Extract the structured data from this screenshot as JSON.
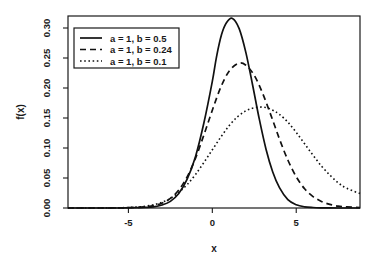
{
  "chart_data": {
    "type": "line",
    "title": "",
    "subtitle": "",
    "xlabel": "x",
    "ylabel": "f(x)",
    "xlim": [
      -8.6,
      8.8
    ],
    "ylim": [
      0.0,
      0.32
    ],
    "grid": false,
    "legend_position": "top-left",
    "x_ticks": [
      -5,
      0,
      5
    ],
    "x_tick_labels": [
      "-5",
      "0",
      "5"
    ],
    "y_ticks": [
      0.0,
      0.05,
      0.1,
      0.15,
      0.2,
      0.25,
      0.3
    ],
    "y_tick_labels": [
      "0.00",
      "0.05",
      "0.10",
      "0.15",
      "0.20",
      "0.25",
      "0.30"
    ],
    "series": [
      {
        "name": "a = 1, b = 0.5",
        "style": "solid",
        "color": "#111111",
        "peak_x": 0.55,
        "peak_y": 0.316,
        "params": {
          "a": 1,
          "b": 0.5
        },
        "x": [
          -8.6,
          -7.5,
          -6.5,
          -5.5,
          -4.5,
          -4.0,
          -3.5,
          -3.0,
          -2.5,
          -2.0,
          -1.5,
          -1.0,
          -0.5,
          0.0,
          0.25,
          0.55,
          0.85,
          1.2,
          1.6,
          2.0,
          2.4,
          2.8,
          3.2,
          3.6,
          4.0,
          4.5,
          5.0,
          5.5,
          6.0,
          6.5,
          7.0,
          7.5,
          8.0,
          8.8
        ],
        "y": [
          0.0,
          0.0,
          0.0,
          0.0,
          0.0005,
          0.001,
          0.002,
          0.005,
          0.011,
          0.024,
          0.048,
          0.086,
          0.142,
          0.211,
          0.252,
          0.289,
          0.309,
          0.316,
          0.299,
          0.259,
          0.205,
          0.148,
          0.098,
          0.06,
          0.034,
          0.014,
          0.0055,
          0.002,
          0.0008,
          0.0003,
          0.0001,
          0.0,
          0.0,
          0.0
        ]
      },
      {
        "name": "a = 1, b = 0.24",
        "style": "dashed",
        "color": "#111111",
        "peak_x": 1.55,
        "peak_y": 0.241,
        "params": {
          "a": 1,
          "b": 0.24
        },
        "x": [
          -8.6,
          -7.5,
          -6.5,
          -5.5,
          -4.5,
          -4.0,
          -3.5,
          -3.0,
          -2.5,
          -2.0,
          -1.5,
          -1.0,
          -0.5,
          0.0,
          0.5,
          1.0,
          1.55,
          2.0,
          2.5,
          3.0,
          3.5,
          4.0,
          4.5,
          5.0,
          5.5,
          6.0,
          6.5,
          7.0,
          7.5,
          8.0,
          8.8
        ],
        "y": [
          0.0,
          0.0,
          0.0,
          0.0002,
          0.001,
          0.002,
          0.004,
          0.008,
          0.016,
          0.03,
          0.052,
          0.083,
          0.122,
          0.163,
          0.201,
          0.228,
          0.241,
          0.238,
          0.221,
          0.191,
          0.154,
          0.115,
          0.08,
          0.052,
          0.032,
          0.019,
          0.011,
          0.006,
          0.003,
          0.0018,
          0.0008
        ]
      },
      {
        "name": "a = 1, b = 0.1",
        "style": "dotted",
        "color": "#111111",
        "peak_x": 3.1,
        "peak_y": 0.168,
        "params": {
          "a": 1,
          "b": 0.1
        },
        "x": [
          -8.6,
          -7.5,
          -6.5,
          -5.5,
          -4.5,
          -4.0,
          -3.5,
          -3.0,
          -2.5,
          -2.0,
          -1.5,
          -1.0,
          -0.5,
          0.0,
          0.5,
          1.0,
          1.5,
          2.0,
          2.5,
          3.1,
          3.6,
          4.0,
          4.5,
          5.0,
          5.5,
          6.0,
          6.5,
          7.0,
          7.5,
          8.0,
          8.8
        ],
        "y": [
          0.0,
          0.0,
          0.0001,
          0.0004,
          0.0016,
          0.003,
          0.0055,
          0.0095,
          0.016,
          0.026,
          0.039,
          0.056,
          0.076,
          0.097,
          0.118,
          0.137,
          0.152,
          0.162,
          0.167,
          0.168,
          0.163,
          0.156,
          0.143,
          0.126,
          0.107,
          0.088,
          0.07,
          0.055,
          0.042,
          0.033,
          0.024
        ]
      }
    ]
  },
  "axes": {
    "x_title": "x",
    "y_title": "f(x)"
  },
  "legend": {
    "entries": [
      {
        "label": "a = 1, b = 0.5",
        "style": "solid"
      },
      {
        "label": "a = 1, b = 0.24",
        "style": "dashed"
      },
      {
        "label": "a = 1, b = 0.1",
        "style": "dotted"
      }
    ]
  }
}
